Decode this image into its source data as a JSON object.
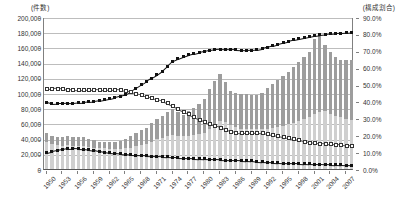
{
  "chart_data": {
    "type": "bar",
    "title": "",
    "subtitle": "",
    "xlabel": "",
    "ylabel": "(件数)",
    "y2label": "(構成割合)",
    "ylim": [
      0,
      200000
    ],
    "y2lim": [
      0,
      0.9
    ],
    "grid": true,
    "legend": "none",
    "y_ticks": [
      "0",
      "20,000",
      "40,000",
      "60,000",
      "80,000",
      "100,000",
      "120,000",
      "140,000",
      "160,000",
      "180,000",
      "200,000"
    ],
    "y_tick_values": [
      0,
      20000,
      40000,
      60000,
      80000,
      100000,
      120000,
      140000,
      160000,
      180000,
      200000
    ],
    "y2_ticks": [
      "0.0%",
      "10.0%",
      "20.0%",
      "30.0%",
      "40.0%",
      "50.0%",
      "60.0%",
      "70.0%",
      "80.0%",
      "90.0%"
    ],
    "y2_tick_values": [
      0,
      10,
      20,
      30,
      40,
      50,
      60,
      70,
      80,
      90
    ],
    "categories": [
      1950,
      1951,
      1952,
      1953,
      1954,
      1955,
      1956,
      1957,
      1958,
      1959,
      1960,
      1961,
      1962,
      1963,
      1964,
      1965,
      1966,
      1967,
      1968,
      1969,
      1970,
      1971,
      1972,
      1973,
      1974,
      1975,
      1976,
      1977,
      1978,
      1979,
      1980,
      1981,
      1982,
      1983,
      1984,
      1985,
      1986,
      1987,
      1988,
      1989,
      1990,
      1991,
      1992,
      1993,
      1994,
      1995,
      1996,
      1997,
      1998,
      1999,
      2000,
      2001,
      2002,
      2003,
      2004,
      2005,
      2006,
      2007,
      2008
    ],
    "x_tick_labels": [
      "1950",
      "1953",
      "1956",
      "1959",
      "1962",
      "1965",
      "1968",
      "1971",
      "1974",
      "1977",
      "1980",
      "1983",
      "1986",
      "1989",
      "1992",
      "1995",
      "1998",
      "2001",
      "2004",
      "2007"
    ],
    "series": [
      {
        "name": "件数-下段",
        "kind": "bar-stack-lower",
        "axis": "left",
        "color": "#cfcfcf",
        "values": [
          35000,
          33000,
          31000,
          30000,
          31000,
          30000,
          30000,
          30000,
          29000,
          28000,
          27000,
          27000,
          26000,
          26000,
          26000,
          27000,
          28000,
          30000,
          32000,
          33000,
          36000,
          39000,
          41000,
          43000,
          45000,
          44000,
          43000,
          44000,
          45000,
          46000,
          47000,
          52000,
          58000,
          63000,
          62000,
          58000,
          55000,
          53000,
          53000,
          53000,
          52000,
          52000,
          53000,
          54000,
          55000,
          57000,
          59000,
          61000,
          63000,
          66000,
          69000,
          73000,
          75000,
          76000,
          73000,
          70000,
          68000,
          66000,
          65000
        ]
      },
      {
        "name": "件数-上段",
        "kind": "bar-stack-upper",
        "axis": "left",
        "color": "#9d9d9d",
        "values": [
          12000,
          10000,
          11000,
          12000,
          13000,
          12000,
          12000,
          12000,
          11000,
          10000,
          9000,
          9000,
          9000,
          10000,
          11000,
          13000,
          15000,
          17000,
          19000,
          21000,
          25000,
          27000,
          29000,
          32000,
          34000,
          31000,
          28000,
          32000,
          35000,
          40000,
          45000,
          53000,
          58000,
          62000,
          53000,
          45000,
          45000,
          46000,
          46000,
          45000,
          45000,
          48000,
          54000,
          58000,
          62000,
          66000,
          69000,
          73000,
          78000,
          82000,
          85000,
          98000,
          100000,
          87000,
          81000,
          78000,
          76000,
          77000,
          78000
        ]
      },
      {
        "name": "構成割合-上昇",
        "kind": "line",
        "marker": "filled-square",
        "axis": "right",
        "color": "#111111",
        "values": [
          40.0,
          39.2,
          39.4,
          39.4,
          39.6,
          39.5,
          39.8,
          40.0,
          40.3,
          40.6,
          41.0,
          41.6,
          42.2,
          43.0,
          43.8,
          44.7,
          46.5,
          48.5,
          50.5,
          52.5,
          54.4,
          56.3,
          58.6,
          61.5,
          64.5,
          65.8,
          67.0,
          68.1,
          68.9,
          69.7,
          70.3,
          70.9,
          71.4,
          71.6,
          71.5,
          71.4,
          71.2,
          71.0,
          70.9,
          71.0,
          71.3,
          72.0,
          72.8,
          73.7,
          74.6,
          75.4,
          76.2,
          77.0,
          77.7,
          78.4,
          79.0,
          79.6,
          80.0,
          80.3,
          80.6,
          80.9,
          81.1,
          81.3,
          81.6
        ]
      },
      {
        "name": "構成割合-下降",
        "kind": "line",
        "marker": "open-square",
        "axis": "right",
        "color": "#555555",
        "values": [
          48.2,
          48.3,
          48.4,
          48.2,
          47.9,
          47.6,
          47.5,
          47.4,
          47.6,
          47.7,
          47.5,
          47.4,
          47.6,
          47.8,
          47.6,
          47.2,
          46.4,
          45.5,
          44.6,
          43.7,
          42.8,
          41.9,
          41.0,
          39.7,
          38.0,
          36.4,
          34.9,
          33.2,
          31.5,
          30.0,
          28.7,
          27.5,
          26.4,
          25.3,
          24.0,
          22.8,
          22.2,
          22.0,
          22.0,
          22.1,
          22.2,
          22.0,
          21.6,
          21.0,
          20.4,
          19.8,
          19.2,
          18.5,
          17.8,
          17.1,
          16.5,
          16.0,
          15.8,
          15.6,
          15.4,
          15.2,
          15.0,
          14.8,
          14.6
        ]
      },
      {
        "name": "構成割合-低位",
        "kind": "line",
        "marker": "filled-square",
        "axis": "right",
        "color": "#111111",
        "values": [
          10.2,
          11.0,
          11.6,
          12.2,
          12.6,
          12.8,
          12.6,
          12.4,
          12.1,
          11.6,
          11.0,
          10.6,
          10.2,
          9.9,
          9.6,
          9.3,
          9.0,
          8.8,
          8.6,
          8.4,
          8.2,
          8.0,
          7.9,
          7.7,
          7.5,
          7.3,
          7.1,
          6.9,
          6.8,
          6.7,
          6.6,
          6.5,
          6.3,
          6.1,
          5.9,
          5.8,
          5.7,
          5.6,
          5.5,
          5.4,
          5.0,
          4.8,
          4.6,
          4.4,
          4.2,
          4.1,
          4.0,
          3.9,
          3.8,
          3.7,
          3.6,
          3.5,
          3.4,
          3.3,
          3.2,
          3.1,
          3.0,
          2.9,
          2.8
        ]
      }
    ]
  }
}
